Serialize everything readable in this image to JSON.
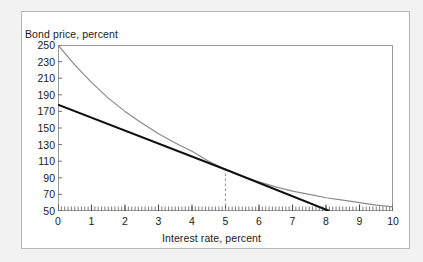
{
  "figure": {
    "y_axis_title": "Bond price, percent",
    "x_axis_title": "Interest rate, percent"
  },
  "chart_data": {
    "type": "line",
    "title": "",
    "xlabel": "Interest rate, percent",
    "ylabel": "Bond price, percent",
    "xlim": [
      0,
      10
    ],
    "ylim": [
      50,
      250
    ],
    "grid": false,
    "legend": "none",
    "xticks": [
      0,
      1,
      2,
      3,
      4,
      5,
      6,
      7,
      8,
      9,
      10
    ],
    "yticks": [
      50,
      70,
      90,
      110,
      130,
      150,
      170,
      190,
      210,
      230,
      250
    ],
    "x_minor_ticks_per_interval": 10,
    "annotations": [
      {
        "name": "tangency-dashed-line",
        "type": "vertical-dashed-line",
        "x": 5,
        "y_from": 50,
        "y_to": 100,
        "color": "#9a9a9a"
      }
    ],
    "series": [
      {
        "name": "bond-price-curve",
        "style": "solid",
        "color": "#8a8a8a",
        "width": 1.2,
        "x": [
          0,
          0.5,
          1,
          1.5,
          2,
          2.5,
          3,
          3.5,
          4,
          4.5,
          5,
          5.5,
          6,
          6.5,
          7,
          7.5,
          8,
          8.5,
          9,
          9.5,
          10
        ],
        "values": [
          250,
          226,
          205,
          186,
          170,
          156,
          143,
          132,
          122,
          110,
          100,
          92,
          85,
          79,
          74,
          70,
          66,
          63,
          60,
          57,
          55
        ]
      },
      {
        "name": "tangent-line",
        "style": "solid",
        "color": "#111111",
        "width": 2.0,
        "x": [
          0,
          5,
          8.1
        ],
        "values": [
          178,
          100,
          50
        ]
      }
    ]
  }
}
